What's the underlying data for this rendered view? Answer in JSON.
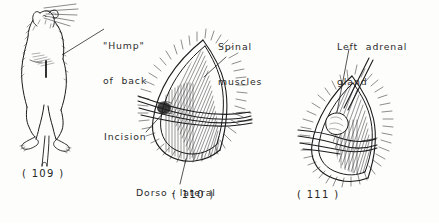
{
  "plate": {
    "title": "Adrenalectomy surgical plate",
    "background_color": "#fdfdfc",
    "ink_color": "#1c1c1c",
    "width": 439,
    "height": 223
  },
  "labels": {
    "hump_line1": "\"Hump\"",
    "hump_line2": "of  back",
    "spinal_line1": "Spinal",
    "spinal_line2": "muscles",
    "adrenal_line1": "Left  adrenal",
    "adrenal_line2": "gland",
    "incision": "Incision",
    "dorso_line1": "Dorso - lateral",
    "dorso_line2": "abdominal  muscles"
  },
  "figures": {
    "fig109": "( 109 )",
    "fig110": "( 110 )",
    "fig111": "( 111 )"
  },
  "icons": {
    "rat": "rat-standing-illustration",
    "incision_open": "open-incision-illustration",
    "adrenal_exposed": "adrenal-gland-exposed-illustration"
  }
}
